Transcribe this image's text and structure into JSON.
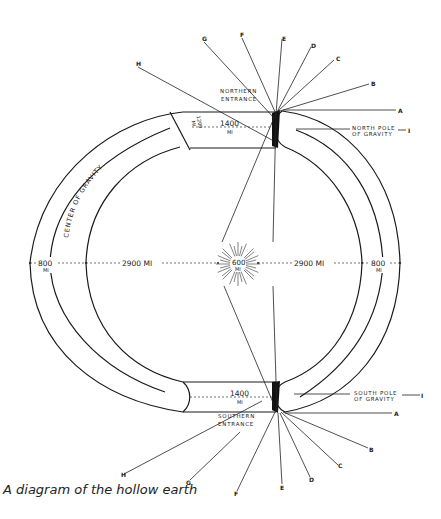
{
  "caption": "A diagram of the hollow earth",
  "labels": {
    "northern_entrance_1": "NORTHERN",
    "northern_entrance_2": "ENTRANCE",
    "southern_entrance_1": "SOUTHERN",
    "southern_entrance_2": "ENTRANCE",
    "north_pole_1": "NORTH POLE",
    "north_pole_2": "OF GRAVITY",
    "north_pole_marker": "I",
    "south_pole_1": "SOUTH POLE",
    "south_pole_2": "OF GRAVITY",
    "south_pole_marker": "I",
    "center_of_gravity": "CENTER OF GRAVITY"
  },
  "dimensions": {
    "north_tunnel": "1400",
    "north_tunnel_unit": "MI",
    "south_tunnel": "1400",
    "south_tunnel_unit": "MI",
    "crust_top": "1200",
    "crust_top_unit": "MI",
    "left_shell": "800",
    "left_shell_unit": "MI",
    "right_shell": "800",
    "right_shell_unit": "MI",
    "left_interior": "2900 MI",
    "right_interior": "2900 MI",
    "central_sun": "600",
    "central_sun_unit": "MI"
  },
  "north_rays": [
    "A",
    "B",
    "C",
    "D",
    "E",
    "F",
    "G",
    "H"
  ],
  "south_rays": [
    "A",
    "B",
    "C",
    "D",
    "E",
    "F",
    "G",
    "H"
  ]
}
